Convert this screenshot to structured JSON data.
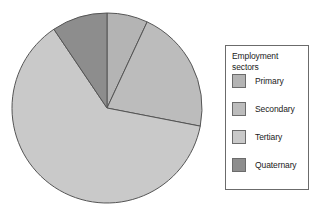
{
  "legend": {
    "title": "Employment sectors",
    "title_line1": "Employment",
    "title_line2": "sectors",
    "items": [
      {
        "label": "Primary",
        "color": "#b4b4b4"
      },
      {
        "label": "Secondary",
        "color": "#bcbcbc"
      },
      {
        "label": "Tertiary",
        "color": "#c9c9c9"
      },
      {
        "label": "Quaternary",
        "color": "#8d8d8d"
      }
    ]
  },
  "caption": "",
  "chart_data": {
    "type": "pie",
    "title": "",
    "xlabel": "",
    "ylabel": "",
    "legend_position": "right",
    "legend_title": "Employment sectors",
    "grid": false,
    "start_angle": 0,
    "direction": "clockwise",
    "categories": [
      "Primary",
      "Secondary",
      "Tertiary",
      "Quaternary"
    ],
    "values": [
      7,
      21,
      62,
      10
    ],
    "unit": "percent",
    "slices": [
      {
        "label": "Primary",
        "value": 7,
        "color": "#b4b4b4",
        "start_deg": 0,
        "end_deg": 25
      },
      {
        "label": "Secondary",
        "value": 21,
        "color": "#bcbcbc",
        "start_deg": 25,
        "end_deg": 101
      },
      {
        "label": "Tertiary",
        "value": 62,
        "color": "#c9c9c9",
        "start_deg": 101,
        "end_deg": 326
      },
      {
        "label": "Quaternary",
        "value": 10,
        "color": "#8d8d8d",
        "start_deg": 326,
        "end_deg": 360
      }
    ],
    "stroke_color": "#555555",
    "center": {
      "x": 107,
      "y": 108
    },
    "radius": 95
  }
}
